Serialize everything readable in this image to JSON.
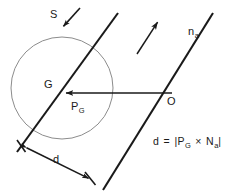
{
  "figure": {
    "type": "geometry-diagram",
    "background_color": "#ffffff",
    "stroke_color": "#1a1a1a",
    "circle_stroke_color": "#8c8c8c",
    "labels": {
      "sphere": "S",
      "normal_base": "n",
      "normal_sub": "a",
      "center": "G",
      "vector_base": "P",
      "vector_sub": "G",
      "origin": "O",
      "distance": "d"
    },
    "formula": {
      "lhs": "d",
      "equals": "=",
      "open_bar": "|",
      "term1_base": "P",
      "term1_sub": "G",
      "cross": "×",
      "term2_base": "N",
      "term2_sub": "a",
      "close_bar": "|",
      "plain_text": "d = | P_G × N_a |"
    },
    "geometry": {
      "circle": {
        "cx": 62,
        "cy": 88,
        "r": 51
      },
      "line_left": {
        "x1": 118,
        "y1": 13,
        "x2": 17,
        "y2": 152
      },
      "line_right": {
        "x1": 213,
        "y1": 13,
        "x2": 103,
        "y2": 190
      },
      "vector_PG": {
        "x1": 172,
        "y1": 93,
        "x2": 63,
        "y2": 93
      },
      "vector_na": {
        "x1": 137,
        "y1": 54,
        "x2": 159,
        "y2": 20
      },
      "pointer_S": {
        "x1": 80,
        "y1": 8,
        "x2": 62,
        "y2": 28
      },
      "distance_arrow": {
        "x1": 23,
        "y1": 146,
        "x2": 92,
        "y2": 180
      }
    }
  }
}
